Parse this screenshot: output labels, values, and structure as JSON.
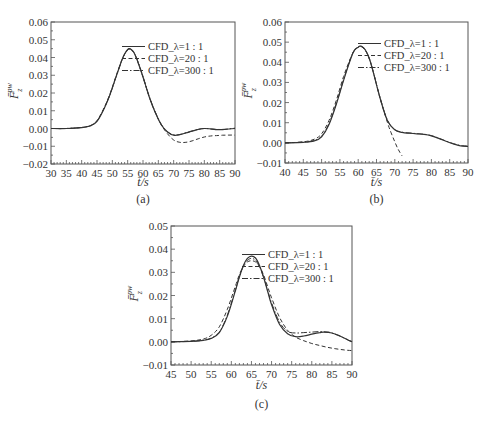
{
  "figure": {
    "captions": [
      "(a)",
      "(b)",
      "(c)"
    ]
  },
  "chart_data": [
    {
      "type": "line",
      "panel": "(a)",
      "xlabel": "t̄/s",
      "ylabel": "F̄_z^pw",
      "xlim": [
        30,
        90
      ],
      "ylim": [
        -0.02,
        0.06
      ],
      "xticks": [
        30,
        35,
        40,
        45,
        50,
        55,
        60,
        65,
        70,
        75,
        80,
        85,
        90
      ],
      "yticks": [
        "-0.02",
        "-0.01",
        "0.00",
        "0.01",
        "0.02",
        "0.03",
        "0.04",
        "0.05",
        "0.06"
      ],
      "grid": false,
      "legend_position": "upper right",
      "series": [
        {
          "name": "CFD_λ=1:1",
          "style": "solid",
          "x": [
            30,
            35,
            40,
            43,
            45,
            47,
            49,
            51,
            53,
            54,
            55,
            55.5,
            56,
            57,
            58,
            60,
            62,
            64,
            66,
            68,
            70,
            72,
            74,
            76,
            78,
            80,
            82,
            84,
            86,
            88,
            90
          ],
          "y": [
            0.0,
            0.0,
            0.0005,
            0.0015,
            0.004,
            0.01,
            0.018,
            0.028,
            0.038,
            0.042,
            0.0445,
            0.045,
            0.0448,
            0.043,
            0.039,
            0.029,
            0.018,
            0.009,
            0.002,
            -0.002,
            -0.0038,
            -0.0035,
            -0.0025,
            -0.0015,
            -0.0005,
            0.0,
            -0.0002,
            -0.0006,
            -0.0006,
            -0.0003,
            0.0
          ]
        },
        {
          "name": "CFD_λ=20:1",
          "style": "dashed",
          "x": [
            30,
            35,
            40,
            43,
            45,
            47,
            49,
            51,
            53,
            54,
            55,
            55.5,
            56,
            57,
            58,
            60,
            62,
            64,
            66,
            68,
            70,
            72,
            74,
            76,
            78,
            80,
            82,
            84,
            86,
            88,
            90
          ],
          "y": [
            0.0,
            0.0,
            0.0006,
            0.0018,
            0.0045,
            0.0105,
            0.0185,
            0.0285,
            0.038,
            0.042,
            0.0443,
            0.0448,
            0.0446,
            0.0428,
            0.039,
            0.029,
            0.018,
            0.009,
            0.002,
            -0.003,
            -0.0065,
            -0.0078,
            -0.0078,
            -0.007,
            -0.0058,
            -0.0048,
            -0.0042,
            -0.004,
            -0.0038,
            -0.0037,
            -0.0037
          ]
        },
        {
          "name": "CFD_λ=300:1",
          "style": "dashdot",
          "x": [
            30,
            35,
            40,
            43,
            45,
            47,
            49,
            51,
            53,
            54,
            55,
            55.5,
            56,
            57,
            58,
            60,
            62,
            64,
            66,
            68,
            70,
            72,
            74,
            76,
            78,
            80,
            82,
            84,
            86,
            88,
            90
          ],
          "y": [
            0.0,
            0.0,
            0.0006,
            0.0017,
            0.0042,
            0.0102,
            0.018,
            0.028,
            0.0378,
            0.0418,
            0.0442,
            0.0447,
            0.0446,
            0.0429,
            0.0392,
            0.0293,
            0.0183,
            0.0092,
            0.0022,
            -0.0018,
            -0.0036,
            -0.0034,
            -0.0024,
            -0.0014,
            -0.0005,
            0.0,
            -0.0002,
            -0.0005,
            -0.0005,
            -0.0002,
            0.0002
          ]
        }
      ]
    },
    {
      "type": "line",
      "panel": "(b)",
      "xlabel": "t̄/s",
      "ylabel": "F̄_z^pw",
      "xlim": [
        40,
        90
      ],
      "ylim": [
        -0.01,
        0.06
      ],
      "xticks": [
        40,
        45,
        50,
        55,
        60,
        65,
        70,
        75,
        80,
        85,
        90
      ],
      "yticks": [
        "-0.01",
        "0.00",
        "0.01",
        "0.02",
        "0.03",
        "0.04",
        "0.05",
        "0.06"
      ],
      "grid": false,
      "legend_position": "upper right",
      "series": [
        {
          "name": "CFD_λ=1:1",
          "style": "solid",
          "x": [
            40,
            45,
            48,
            50,
            52,
            54,
            56,
            58,
            59,
            60,
            60.5,
            61,
            62,
            63,
            64,
            66,
            68,
            70,
            72,
            74,
            76,
            78,
            80,
            82,
            84,
            86,
            88,
            90
          ],
          "y": [
            0.0,
            0.0003,
            0.001,
            0.003,
            0.009,
            0.019,
            0.031,
            0.042,
            0.046,
            0.0475,
            0.048,
            0.0478,
            0.046,
            0.042,
            0.036,
            0.022,
            0.011,
            0.0065,
            0.0052,
            0.0048,
            0.0045,
            0.0042,
            0.0035,
            0.0022,
            0.0008,
            -0.0005,
            -0.0015,
            -0.0018
          ]
        },
        {
          "name": "CFD_λ=20:1",
          "style": "dashed",
          "x": [
            40,
            45,
            48,
            50,
            52,
            54,
            56,
            58,
            59,
            60,
            60.5,
            61,
            62,
            63,
            64,
            66,
            68,
            69,
            70,
            71,
            72
          ],
          "y": [
            0.0,
            0.0005,
            0.0018,
            0.0045,
            0.011,
            0.021,
            0.033,
            0.0425,
            0.046,
            0.0475,
            0.0478,
            0.0476,
            0.0458,
            0.0418,
            0.036,
            0.022,
            0.01,
            0.005,
            0.0005,
            -0.0035,
            -0.0065
          ]
        },
        {
          "name": "CFD_λ=300:1",
          "style": "dashdot",
          "x": [
            40,
            45,
            48,
            50,
            52,
            54,
            56,
            58,
            59,
            60,
            60.5,
            61,
            62,
            63,
            64,
            66,
            68,
            70,
            72,
            74,
            76,
            78,
            80,
            82,
            84,
            86,
            88,
            90
          ],
          "y": [
            0.0,
            0.0004,
            0.0012,
            0.0033,
            0.0095,
            0.0195,
            0.0315,
            0.0423,
            0.046,
            0.0476,
            0.048,
            0.0478,
            0.0461,
            0.0421,
            0.036,
            0.0222,
            0.0112,
            0.0066,
            0.0053,
            0.0049,
            0.0046,
            0.0043,
            0.0036,
            0.0023,
            0.0009,
            -0.0004,
            -0.0013,
            -0.0016
          ]
        }
      ]
    },
    {
      "type": "line",
      "panel": "(c)",
      "xlabel": "t̄/s",
      "ylabel": "F̄_z^pw",
      "xlim": [
        45,
        90
      ],
      "ylim": [
        -0.01,
        0.05
      ],
      "xticks": [
        45,
        50,
        55,
        60,
        65,
        70,
        75,
        80,
        85,
        90
      ],
      "yticks": [
        "-0.01",
        "0.00",
        "0.01",
        "0.02",
        "0.03",
        "0.04",
        "0.05"
      ],
      "grid": false,
      "legend_position": "upper right",
      "series": [
        {
          "name": "CFD_λ=1:1",
          "style": "solid",
          "x": [
            45,
            50,
            53,
            55,
            57,
            59,
            61,
            62,
            63,
            64,
            65,
            66,
            67,
            68,
            69,
            70,
            72,
            74,
            76,
            78,
            80,
            82,
            83,
            85,
            87,
            89,
            90
          ],
          "y": [
            0.0,
            0.0002,
            0.0006,
            0.0015,
            0.004,
            0.011,
            0.022,
            0.028,
            0.033,
            0.036,
            0.037,
            0.0362,
            0.033,
            0.028,
            0.022,
            0.016,
            0.0075,
            0.0035,
            0.0022,
            0.0025,
            0.0033,
            0.004,
            0.0042,
            0.0038,
            0.0025,
            0.0008,
            0.0
          ]
        },
        {
          "name": "CFD_λ=20:1",
          "style": "dashed",
          "x": [
            45,
            50,
            53,
            55,
            57,
            59,
            61,
            62,
            63,
            64,
            65,
            66,
            67,
            68,
            69,
            70,
            72,
            74,
            76,
            78,
            80,
            82,
            84,
            86,
            88,
            90
          ],
          "y": [
            0.0,
            0.0004,
            0.0012,
            0.0028,
            0.0065,
            0.014,
            0.024,
            0.029,
            0.0325,
            0.0345,
            0.035,
            0.0345,
            0.0325,
            0.029,
            0.024,
            0.019,
            0.0105,
            0.005,
            0.002,
            0.0005,
            -0.0007,
            -0.0016,
            -0.0024,
            -0.003,
            -0.0035,
            -0.0038
          ]
        },
        {
          "name": "CFD_λ=300:1",
          "style": "dashdot",
          "x": [
            45,
            50,
            53,
            55,
            57,
            59,
            61,
            62,
            63,
            64,
            65,
            66,
            67,
            68,
            69,
            70,
            72,
            74,
            76,
            78,
            80,
            82,
            84,
            85,
            87,
            89,
            90
          ],
          "y": [
            0.0,
            0.0002,
            0.0007,
            0.0016,
            0.0042,
            0.0115,
            0.0225,
            0.0282,
            0.0328,
            0.0352,
            0.036,
            0.0352,
            0.0325,
            0.028,
            0.0225,
            0.0168,
            0.0085,
            0.0045,
            0.0038,
            0.004,
            0.0042,
            0.0044,
            0.0042,
            0.0038,
            0.0025,
            0.0008,
            0.0
          ]
        }
      ]
    }
  ],
  "panels": [
    {
      "caption": "(a)",
      "xlabel": "t̄/s",
      "ylabel_main": "F̄",
      "ylabel_sub": "z",
      "ylabel_sup": "pw",
      "legend": [
        "CFD_λ=1 : 1",
        "CFD_λ=20 : 1",
        "CFD_λ=300 : 1"
      ]
    },
    {
      "caption": "(b)",
      "xlabel": "t̄/s",
      "ylabel_main": "F̄",
      "ylabel_sub": "z",
      "ylabel_sup": "pw",
      "legend": [
        "CFD_λ=1 : 1",
        "CFD_λ=20 : 1",
        "CFD_λ=300 : 1"
      ]
    },
    {
      "caption": "(c)",
      "xlabel": "t̄/s",
      "ylabel_main": "F̄",
      "ylabel_sub": "z",
      "ylabel_sup": "pw",
      "legend": [
        "CFD_λ=1 : 1",
        "CFD_λ=20 : 1",
        "CFD_λ=300 : 1"
      ]
    }
  ],
  "colors": {
    "axis": "#555555",
    "line": "#333333",
    "text": "#333333"
  }
}
